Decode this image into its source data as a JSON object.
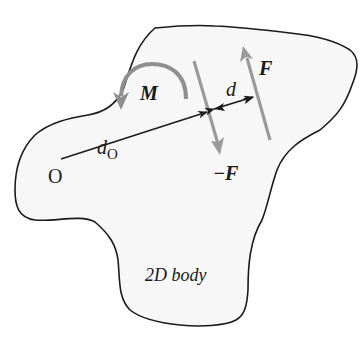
{
  "diagram": {
    "type": "free-body diagram of a couple",
    "body": {
      "label": "2D body",
      "fill": "#f7f7f7",
      "stroke": "#1a1a1a"
    },
    "point_O": {
      "label": "O"
    },
    "moment_arm": {
      "label_main": "d",
      "label_sub": "O"
    },
    "moment": {
      "label": "M",
      "color": "#8f8f8f"
    },
    "force_pos": {
      "label": "F",
      "color": "#9a9a9a"
    },
    "force_neg": {
      "label": "−F",
      "color": "#9a9a9a"
    },
    "couple_distance": {
      "label": "d"
    },
    "colors": {
      "outline": "#1a1a1a",
      "force_gray": "#9a9a9a",
      "text": "#1a1a1a"
    }
  }
}
